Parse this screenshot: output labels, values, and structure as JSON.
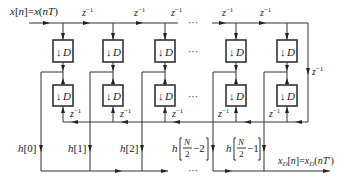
{
  "diagram": {
    "type": "polyphase decimation FIR filter structure",
    "input_label": "x[n]=x(nT)",
    "output_label": "x_D[n]=x_D(nT')",
    "delay_label": "z^-1",
    "decimator_label": "↓D",
    "ellipsis": "···",
    "columns": [
      {
        "id": "c0",
        "tap_label": "h[0]"
      },
      {
        "id": "c1",
        "tap_label": "h[1]"
      },
      {
        "id": "c2",
        "tap_label": "h[2]"
      },
      {
        "id": "c3",
        "tap_label": "h[N/2−2]"
      },
      {
        "id": "c4",
        "tap_label": "h[N/2−1]"
      }
    ],
    "labels": {
      "x_in_a": "x",
      "x_in_b": "[",
      "n": "n",
      "eq": "]=",
      "x_in_c": "x(",
      "nT": "nT",
      "close": ")",
      "z": "z",
      "neg1": "−1",
      "D": "D",
      "down_arrow": "↓",
      "h": "h",
      "h0": "[0]",
      "h1": "[1]",
      "h2": "[2]",
      "N": "N",
      "two": "2",
      "minus2": "−2",
      "minus1": "−1",
      "xD_x": "x",
      "xD_sub": "D",
      "xD_n": "[n]=",
      "xD_x2": "x",
      "xD_sub2": "D",
      "xD_arg": "(nT′)"
    }
  }
}
